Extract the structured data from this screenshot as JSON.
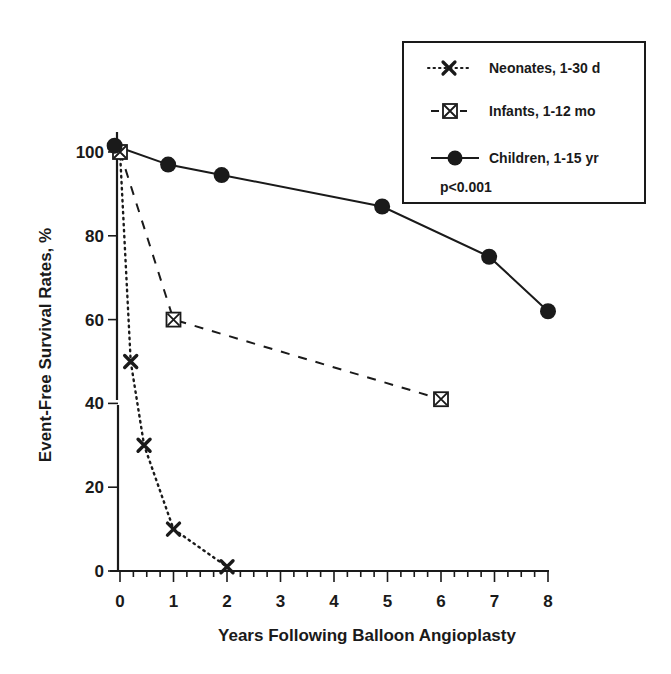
{
  "chart_data": {
    "type": "line",
    "title": "",
    "xlabel": "Years Following Balloon Angioplasty",
    "ylabel": "Event-Free Survival Rates, %",
    "xlim": [
      0,
      8
    ],
    "ylim": [
      0,
      100
    ],
    "x_ticks": [
      0,
      1,
      2,
      3,
      4,
      5,
      6,
      7,
      8
    ],
    "y_ticks": [
      0,
      20,
      40,
      60,
      80,
      100
    ],
    "x_minor_tick_step": 0.25,
    "grid": false,
    "legend_position": "top-right",
    "annotation": "p<0.001",
    "series": [
      {
        "name": "Neonates, 1-30 d",
        "line_style": "dotted",
        "marker": "x",
        "x": [
          0,
          0.2,
          0.45,
          1,
          2
        ],
        "y": [
          100,
          50,
          30,
          10,
          1
        ]
      },
      {
        "name": "Infants, 1-12 mo",
        "line_style": "dashed",
        "marker": "boxed-x",
        "x": [
          0,
          1,
          6
        ],
        "y": [
          100,
          60,
          41
        ]
      },
      {
        "name": "Children, 1-15 yr",
        "line_style": "solid",
        "marker": "filled-circle",
        "x": [
          -0.1,
          0.9,
          1.9,
          4.9,
          6.9,
          8
        ],
        "y": [
          101.5,
          97,
          94.5,
          87,
          75,
          62
        ]
      }
    ]
  },
  "legend": {
    "items": [
      {
        "label": "Neonates, 1-30 d"
      },
      {
        "label": "Infants, 1-12 mo"
      },
      {
        "label": "Children, 1-15 yr"
      }
    ],
    "annotation": "p<0.001"
  },
  "axes": {
    "x_title": "Years Following Balloon Angioplasty",
    "y_title": "Event-Free Survival Rates, %",
    "x_tick_labels": [
      "0",
      "1",
      "2",
      "3",
      "4",
      "5",
      "6",
      "7",
      "8"
    ],
    "y_tick_labels": [
      "0",
      "20",
      "40",
      "60",
      "80",
      "100"
    ]
  },
  "colors": {
    "ink": "#1a1a1a",
    "background": "#ffffff"
  }
}
